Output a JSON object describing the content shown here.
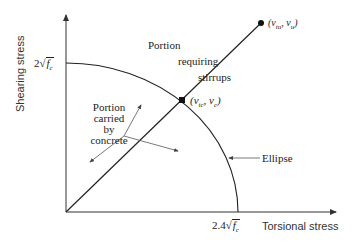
{
  "diagram": {
    "axes": {
      "y_label": "Shearing stress",
      "x_label": "Torsional stress",
      "y_tick": {
        "coef": "2",
        "var": "f",
        "sub": "c"
      },
      "x_tick": {
        "coef": "2.4",
        "var": "f",
        "sub": "c"
      }
    },
    "points": {
      "ultimate": {
        "label": "(v",
        "sub1": "tu",
        "mid": ", v",
        "sub2": "u",
        "end": ")"
      },
      "concrete": {
        "label": "(v",
        "sub1": "tc",
        "mid": ", v",
        "sub2": "c",
        "end": ")"
      }
    },
    "regions": {
      "stirrups": [
        "Portion",
        "requiring",
        "stirrups"
      ],
      "concrete": [
        "Portion",
        "carried",
        "by",
        "concrete"
      ]
    },
    "curve_label": "Ellipse",
    "colors": {
      "line": "#222222",
      "arrow": "#555555",
      "background": "#ffffff"
    }
  }
}
